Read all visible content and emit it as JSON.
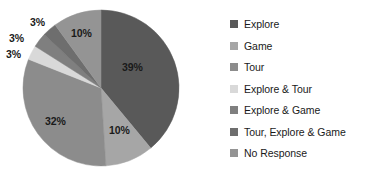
{
  "chart_data": {
    "type": "pie",
    "title": "",
    "categories": [
      "Explore",
      "Game",
      "Tour",
      "Explore & Tour",
      "Explore & Game",
      "Tour, Explore & Game",
      "No Response"
    ],
    "values": [
      39,
      10,
      32,
      3,
      3,
      3,
      10
    ],
    "value_labels": [
      "39%",
      "10%",
      "32%",
      "3%",
      "3%",
      "3%",
      "10%"
    ],
    "units": "percent",
    "legend_position": "right",
    "grid": false,
    "start_angle_deg": 0,
    "direction": "clockwise",
    "colors": [
      "#595959",
      "#a6a6a6",
      "#8c8c8c",
      "#d9d9d9",
      "#7f7f7f",
      "#6e6e6e",
      "#949494"
    ],
    "background": "#ffffff",
    "label_color": "#1a1a1a"
  },
  "pie": {
    "center_x": 101,
    "center_y": 88,
    "radius": 78,
    "labels": [
      {
        "text": "39%",
        "x": 122,
        "y": 62
      },
      {
        "text": "10%",
        "x": 109,
        "y": 125
      },
      {
        "text": "32%",
        "x": 45,
        "y": 116
      },
      {
        "text": "3%",
        "x": 6,
        "y": 49
      },
      {
        "text": "3%",
        "x": 9,
        "y": 33
      },
      {
        "text": "3%",
        "x": 30,
        "y": 17
      },
      {
        "text": "10%",
        "x": 71,
        "y": 28
      }
    ]
  },
  "legend": {
    "items": [
      {
        "label": "Explore",
        "color": "#595959"
      },
      {
        "label": "Game",
        "color": "#a6a6a6"
      },
      {
        "label": "Tour",
        "color": "#8c8c8c"
      },
      {
        "label": "Explore & Tour",
        "color": "#d9d9d9"
      },
      {
        "label": "Explore & Game",
        "color": "#7f7f7f"
      },
      {
        "label": "Tour, Explore & Game",
        "color": "#6e6e6e"
      },
      {
        "label": "No Response",
        "color": "#949494"
      }
    ]
  }
}
